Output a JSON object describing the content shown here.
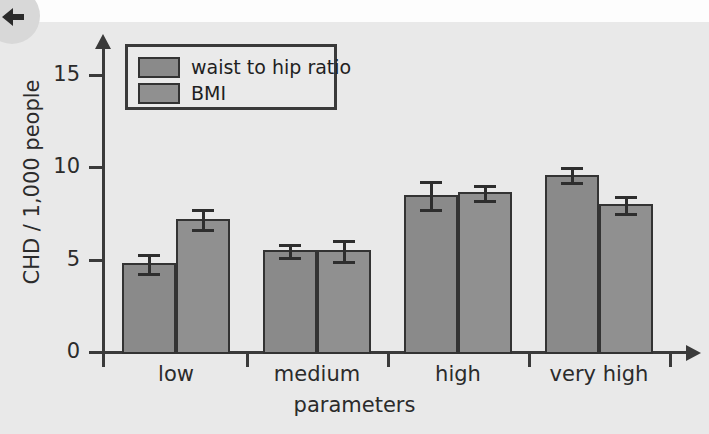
{
  "figure": {
    "background": "#e9e9e9",
    "back_icon": "back-arrow-icon"
  },
  "legend": {
    "position": "top-left-inside",
    "entries": [
      {
        "label": "waist to hip ratio",
        "color": "#8a8a8a"
      },
      {
        "label": "BMI",
        "color": "#909090"
      }
    ]
  },
  "chart_data": {
    "type": "bar",
    "title": "",
    "xlabel": "parameters",
    "ylabel": "CHD / 1,000 people",
    "categories": [
      "low",
      "medium",
      "high",
      "very high"
    ],
    "ylim": [
      0,
      16
    ],
    "yticks": [
      0,
      5,
      10,
      15
    ],
    "ytick_labels": [
      "0",
      "5",
      "10",
      "15"
    ],
    "grid": false,
    "legend_position": "upper left",
    "series": [
      {
        "name": "waist to hip ratio",
        "color": "#8a8a8a",
        "values": [
          4.8,
          5.5,
          8.5,
          9.6
        ],
        "errors": [
          0.5,
          0.35,
          0.75,
          0.4
        ]
      },
      {
        "name": "BMI",
        "color": "#909090",
        "values": [
          7.2,
          5.5,
          8.65,
          8.0
        ],
        "errors": [
          0.55,
          0.55,
          0.4,
          0.45
        ]
      }
    ]
  }
}
